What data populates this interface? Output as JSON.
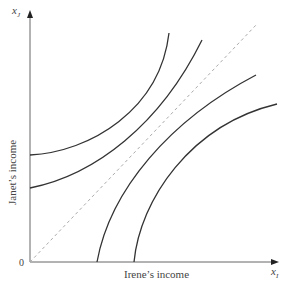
{
  "diagram": {
    "y_axis_label": "Janet’s income",
    "x_axis_label": "Irene’s income",
    "origin_label": "0",
    "y_axis_symbol": "x",
    "y_axis_subscript": "J",
    "x_axis_symbol": "x",
    "x_axis_subscript": "I",
    "curves": [
      {
        "name": "upper-left-curve-1",
        "start": [
          30,
          155
        ],
        "end": [
          169,
          33
        ]
      },
      {
        "name": "upper-left-curve-2",
        "start": [
          30,
          188
        ],
        "end": [
          202,
          40
        ]
      },
      {
        "name": "lower-right-curve-1",
        "start": [
          97,
          262
        ],
        "end": [
          256,
          75
        ]
      },
      {
        "name": "lower-right-curve-2",
        "start": [
          134,
          262
        ],
        "end": [
          277,
          104
        ]
      }
    ],
    "diagonal": {
      "style": "dashed",
      "start": [
        30,
        262
      ],
      "end": [
        257,
        24
      ]
    },
    "colors": {
      "curve": "#333333",
      "axis": "#555555",
      "diagonal": "#aaaaaa"
    }
  }
}
